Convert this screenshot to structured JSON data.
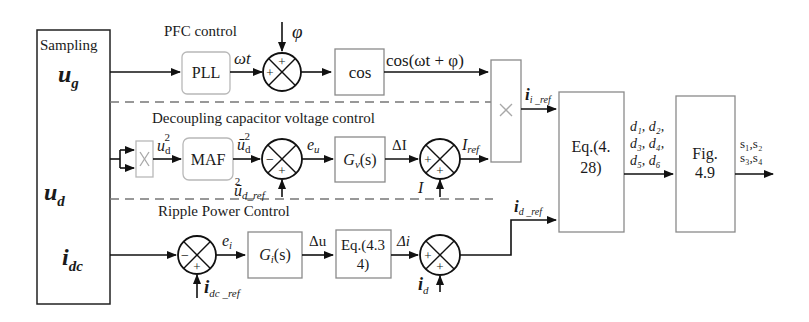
{
  "diagram": {
    "sampling": {
      "title": "Sampling",
      "signals": [
        "u",
        "u",
        "i"
      ],
      "subs": [
        "g",
        "d",
        "dc"
      ]
    },
    "sections": {
      "pfc": "PFC control",
      "decoupling": "Decoupling capacitor voltage control",
      "ripple": "Ripple Power Control"
    },
    "blocks": {
      "pll": "PLL",
      "cos": "cos",
      "maf": "MAF",
      "gv": "G",
      "gv_sub": "v",
      "gv_s": "(s)",
      "gi": "G",
      "gi_sub": "i",
      "gi_s": "(s)",
      "eq434_line1": "Eq.(4.3",
      "eq434_line2": "4)",
      "eq428_line1": "Eq.(4.",
      "eq428_line2": "28)",
      "fig49_line1": "Fig.",
      "fig49_line2": "4.9",
      "multiplier": "×"
    },
    "signals": {
      "omega_t": "ωt",
      "phi": "φ",
      "cos_out": "cos(ωt + φ)",
      "ud2": "u",
      "ud2_sub": "d",
      "ud2_sup": "2",
      "ud_bar2": "ū",
      "ud_bar2_sub": "d",
      "ud_bar2_sup": "2",
      "ud_ref": "ū",
      "ud_ref_sub": "d_ref",
      "ud_ref_sup": "2",
      "eu": "e",
      "eu_sub": "u",
      "delta_I": "ΔI",
      "I": "I",
      "I_ref": "I",
      "I_ref_sub": "ref",
      "ii_ref": "i",
      "ii_ref_sub": "i _ref",
      "id_ref": "i",
      "id_ref_sub": "d _ref",
      "ei": "e",
      "ei_sub": "i",
      "idc_ref": "i",
      "idc_ref_sub": "dc _ref",
      "delta_u": "Δu",
      "delta_i": "Δi",
      "id": "i",
      "id_sub": "d",
      "duty_line1": "d₁, d₂,",
      "duty_line2": "d₃, d₄,",
      "duty_line3": "d₅, d₆",
      "switch_line1": "s₁,s₂",
      "switch_line2": "s₃,s₄"
    },
    "sum_signs": {
      "pfc": [
        "+",
        "+"
      ],
      "dcv": [
        "−",
        "+"
      ],
      "iref": [
        "+",
        "+"
      ],
      "ripple_err": [
        "−",
        "+"
      ],
      "ripple_sum": [
        "+",
        "+"
      ]
    }
  }
}
